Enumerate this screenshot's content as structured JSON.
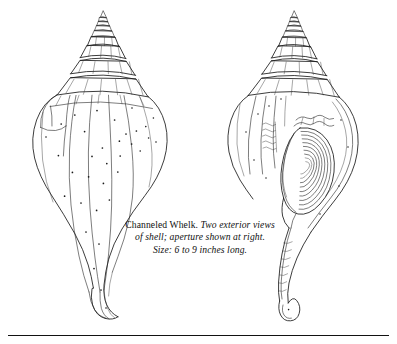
{
  "plate": {
    "title": "Channeled Whelk plate",
    "background_color": "#ffffff",
    "ink_color": "#1a1a1a",
    "width": 397,
    "height": 344
  },
  "caption": {
    "species_name": "Channeled Whelk.",
    "line1_italic": "Two exterior views",
    "line2": "of shell; aperture shown at right.",
    "line3": "Size: 6 to 9 inches long.",
    "full_text": "Channeled Whelk. Two exterior views of shell; aperture shown at right. Size: 6 to 9 inches long."
  },
  "figures": [
    {
      "id": "left-shell",
      "label": "exterior view of shell, dorsal",
      "description": "Channeled whelk shell seen from the back, stepped spire at top, bulbous body whorl with longitudinal growth lines and scattered speckles, tapering to a long siphonal canal."
    },
    {
      "id": "right-shell",
      "label": "exterior view of shell, aperture shown at right",
      "description": "Channeled whelk shell seen from the front with the large oval aperture filled with concentric growth lines and a ridged siphonal canal."
    }
  ],
  "divider": {
    "name": "bottom-rule"
  }
}
